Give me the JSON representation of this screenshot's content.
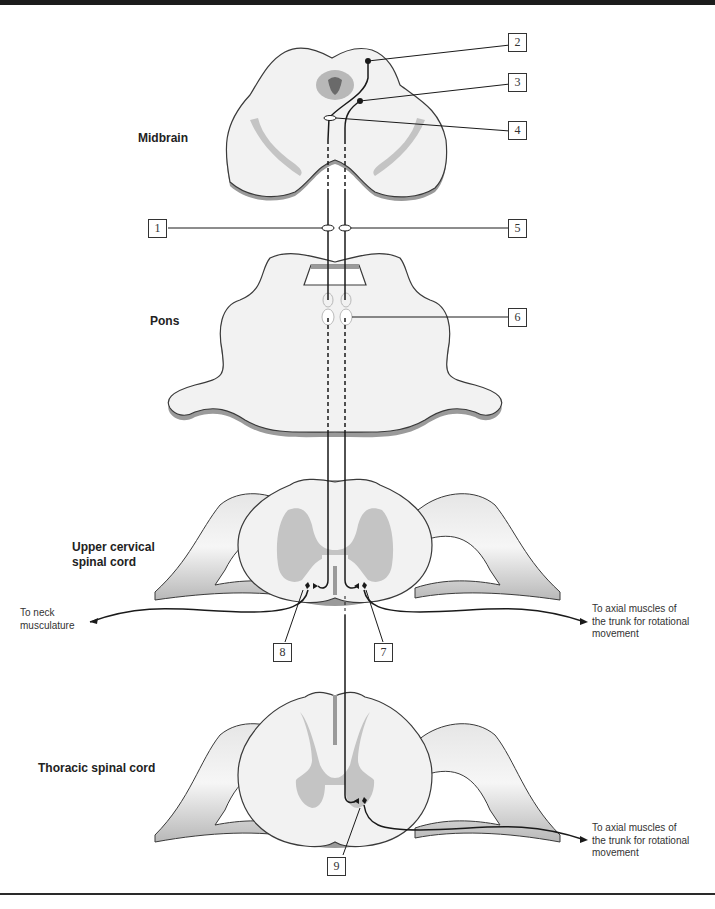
{
  "figure": {
    "regions": {
      "midbrain": "Midbrain",
      "pons": "Pons",
      "upper_cervical_line1": "Upper cervical",
      "upper_cervical_line2": "spinal cord",
      "thoracic": "Thoracic spinal cord"
    },
    "callouts": [
      "1",
      "2",
      "3",
      "4",
      "5",
      "6",
      "7",
      "8",
      "9"
    ],
    "annotations": {
      "neck_line1": "To neck",
      "neck_line2": "musculature",
      "axial_cervical_line1": "To axial muscles of",
      "axial_cervical_line2": "the trunk for rotational",
      "axial_cervical_line3": "movement",
      "axial_thoracic_line1": "To axial muscles of",
      "axial_thoracic_line2": "the trunk for rotational",
      "axial_thoracic_line3": "movement"
    },
    "colors": {
      "tissue_fill": "#f2f2f2",
      "tissue_outline": "#3a3a3a",
      "gray_matter": "#c4c4c4",
      "shadow": "#9a9a9a",
      "pathway": "#1a1a1a"
    }
  }
}
